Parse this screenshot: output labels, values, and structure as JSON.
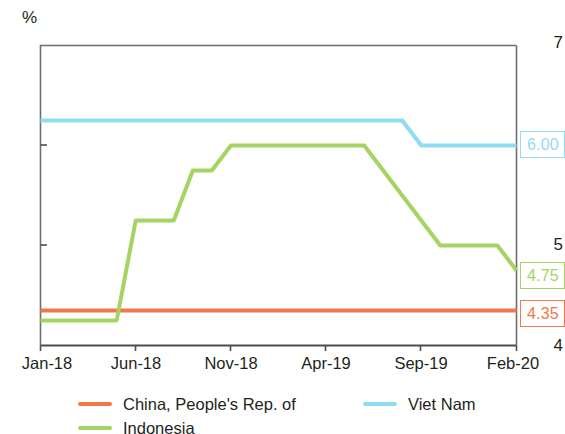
{
  "chart_data": {
    "type": "line",
    "title": "",
    "subtitle": "",
    "xlabel": "",
    "ylabel": "%",
    "unit_label": "%",
    "ylim": [
      4,
      7
    ],
    "yticks": [
      4,
      5,
      6,
      7
    ],
    "ytick_labels": [
      "4",
      "5",
      "6",
      "7"
    ],
    "xtick_labels": [
      "Jan-18",
      "Jun-18",
      "Nov-18",
      "Apr-19",
      "Sep-19",
      "Feb-20"
    ],
    "x_range": [
      "Jan-18",
      "Feb-20"
    ],
    "grid": false,
    "legend_position": "bottom",
    "series": [
      {
        "name": "China, People's Rep. of",
        "color": "#F0784A",
        "end_value": "4.35",
        "points": [
          {
            "x": "Jan-18",
            "y": 4.35
          },
          {
            "x": "Feb-20",
            "y": 4.35
          }
        ]
      },
      {
        "name": "Indonesia",
        "color": "#A5D462",
        "end_value": "4.75",
        "points": [
          {
            "x": "Jan-18",
            "y": 4.25
          },
          {
            "x": "Apr-18",
            "y": 4.25
          },
          {
            "x": "May-18",
            "y": 4.25
          },
          {
            "x": "Jun-18",
            "y": 5.25
          },
          {
            "x": "Aug-18",
            "y": 5.25
          },
          {
            "x": "Sep-18",
            "y": 5.75
          },
          {
            "x": "Oct-18",
            "y": 5.75
          },
          {
            "x": "Nov-18",
            "y": 6.0
          },
          {
            "x": "Jun-19",
            "y": 6.0
          },
          {
            "x": "Oct-19",
            "y": 5.0
          },
          {
            "x": "Jan-20",
            "y": 5.0
          },
          {
            "x": "Feb-20",
            "y": 4.75
          }
        ]
      },
      {
        "name": "Viet Nam",
        "color": "#8EDDF0",
        "end_value": "6.00",
        "points": [
          {
            "x": "Jan-18",
            "y": 6.25
          },
          {
            "x": "Aug-19",
            "y": 6.25
          },
          {
            "x": "Sep-19",
            "y": 6.0
          },
          {
            "x": "Feb-20",
            "y": 6.0
          }
        ]
      }
    ],
    "callouts": [
      {
        "label": "6.00",
        "color": "#8EDDF0",
        "series": "Viet Nam"
      },
      {
        "label": "4.75",
        "color": "#A5D462",
        "series": "Indonesia"
      },
      {
        "label": "4.35",
        "color": "#F0784A",
        "series": "China, People's Rep. of"
      }
    ]
  },
  "legend": {
    "items": [
      {
        "label": "China, People's Rep. of",
        "color": "#F0784A"
      },
      {
        "label": "Viet Nam",
        "color": "#8EDDF0"
      },
      {
        "label": "Indonesia",
        "color": "#A5D462"
      }
    ]
  },
  "axis": {
    "unit": "%",
    "y_labels": [
      "7",
      "6",
      "5",
      "4"
    ],
    "x_labels": [
      "Jan-18",
      "Jun-18",
      "Nov-18",
      "Apr-19",
      "Sep-19",
      "Feb-20"
    ]
  },
  "colors": {
    "china": "#F0784A",
    "indonesia": "#A5D462",
    "vietnam": "#8EDDF0",
    "axis": "#4d4d4d",
    "text": "#231f20"
  }
}
